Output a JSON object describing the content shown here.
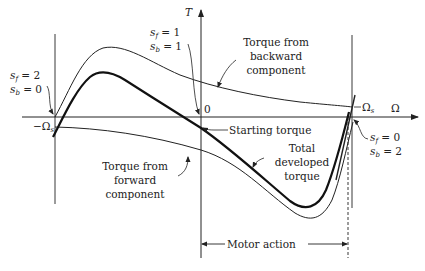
{
  "diagram": {
    "axes": {
      "vertical_label": "T",
      "horizontal_label": "Ω",
      "origin_label": "0",
      "neg_sync_label": "−Ω",
      "neg_sync_sub": "s",
      "pos_sync_label": "Ω",
      "pos_sync_sub": "s"
    },
    "slip_labels": {
      "left": {
        "sf_name": "s",
        "sf_sub": "f",
        "sf_val": " = 2",
        "sb_name": "s",
        "sb_sub": "b",
        "sb_val": " = 0"
      },
      "center": {
        "sf_name": "s",
        "sf_sub": "f",
        "sf_val": " = 1",
        "sb_name": "s",
        "sb_sub": "b",
        "sb_val": " = 1"
      },
      "right": {
        "sf_name": "s",
        "sf_sub": "f",
        "sf_val": " = 0",
        "sb_name": "s",
        "sb_sub": "b",
        "sb_val": " = 2"
      }
    },
    "annotations": {
      "backward": [
        "Torque from",
        "backward",
        "component"
      ],
      "forward": [
        "Torque from",
        "forward",
        "component"
      ],
      "starting": "Starting torque",
      "total": [
        "Total",
        "developed",
        "torque"
      ],
      "motor_action": "Motor action"
    },
    "colors": {
      "line": "#222222",
      "background": "#ffffff"
    }
  }
}
